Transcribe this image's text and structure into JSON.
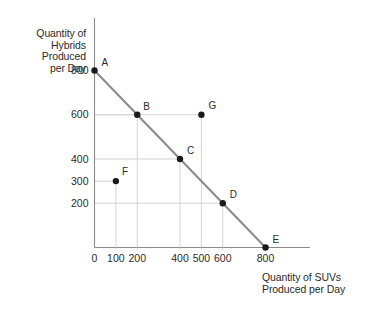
{
  "axes": {
    "y_title_lines": [
      "Quantity of",
      "Hybrids",
      "Produced",
      "per Day"
    ],
    "x_title_lines": [
      "Quantity of SUVs",
      "Produced per Day"
    ]
  },
  "chart_data": {
    "type": "line",
    "title": "",
    "subtitle": "",
    "xlabel": "Quantity of SUVs Produced per Day",
    "ylabel": "Quantity of Hybrids Produced per Day",
    "xlim": [
      0,
      880
    ],
    "ylim": [
      0,
      880
    ],
    "xticks": [
      0,
      100,
      200,
      400,
      500,
      600,
      800
    ],
    "xticklabels": [
      "0",
      "100",
      "200",
      "400",
      "500",
      "600",
      "800"
    ],
    "yticks": [
      200,
      300,
      400,
      600,
      800
    ],
    "yticklabels": [
      "200",
      "300",
      "400",
      "600",
      "800"
    ],
    "grid": true,
    "legend": "none",
    "series": [
      {
        "name": "Production Possibilities Frontier",
        "type": "line",
        "x": [
          0,
          800
        ],
        "y": [
          800,
          0
        ],
        "color": "#8c8c8c"
      }
    ],
    "points": [
      {
        "label": "A",
        "x": 0,
        "y": 800,
        "on_frontier": true,
        "label_dx": 7,
        "label_dy": -4
      },
      {
        "label": "B",
        "x": 200,
        "y": 600,
        "on_frontier": true,
        "label_dx": 6,
        "label_dy": -5
      },
      {
        "label": "C",
        "x": 400,
        "y": 400,
        "on_frontier": true,
        "label_dx": 7,
        "label_dy": -5
      },
      {
        "label": "D",
        "x": 600,
        "y": 200,
        "on_frontier": true,
        "label_dx": 7,
        "label_dy": -5
      },
      {
        "label": "E",
        "x": 800,
        "y": 0,
        "on_frontier": true,
        "label_dx": 7,
        "label_dy": -5
      },
      {
        "label": "F",
        "x": 100,
        "y": 300,
        "on_frontier": false,
        "label_dx": 6,
        "label_dy": -6
      },
      {
        "label": "G",
        "x": 500,
        "y": 600,
        "on_frontier": false,
        "label_dx": 7,
        "label_dy": -6
      }
    ],
    "point_labels": [
      "A",
      "B",
      "C",
      "D",
      "E",
      "F",
      "G"
    ],
    "values": [
      {
        "point": "A",
        "suvs": 0,
        "hybrids": 800
      },
      {
        "point": "B",
        "suvs": 200,
        "hybrids": 600
      },
      {
        "point": "C",
        "suvs": 400,
        "hybrids": 400
      },
      {
        "point": "D",
        "suvs": 600,
        "hybrids": 200
      },
      {
        "point": "E",
        "suvs": 800,
        "hybrids": 0
      },
      {
        "point": "F",
        "suvs": 100,
        "hybrids": 300
      },
      {
        "point": "G",
        "suvs": 500,
        "hybrids": 600
      }
    ]
  },
  "ticks": {
    "x": [
      {
        "value": 0,
        "label": "0"
      },
      {
        "value": 100,
        "label": "100"
      },
      {
        "value": 200,
        "label": "200"
      },
      {
        "value": 400,
        "label": "400"
      },
      {
        "value": 500,
        "label": "500"
      },
      {
        "value": 600,
        "label": "600"
      },
      {
        "value": 800,
        "label": "800"
      }
    ],
    "y": [
      {
        "value": 800,
        "label": "800"
      },
      {
        "value": 600,
        "label": "600"
      },
      {
        "value": 400,
        "label": "400"
      },
      {
        "value": 300,
        "label": "300"
      },
      {
        "value": 200,
        "label": "200"
      }
    ]
  },
  "colors": {
    "axis": "#8a8a8a",
    "grid": "#cfcfcf",
    "frontier": "#8c8c8c",
    "dot": "#1a1a1a",
    "text": "#2b2b2b",
    "background": "#ffffff"
  }
}
